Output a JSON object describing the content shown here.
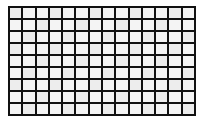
{
  "figure": {
    "kind": "lattice-grid"
  },
  "canvas": {
    "width": 203,
    "height": 122,
    "background_color": "#ffffff"
  },
  "grid": {
    "columns": 14,
    "rows": 9,
    "total_cells": 126,
    "line_color": "#111111",
    "line_width_px": 2,
    "outer_border_width_px": 2,
    "cell_fill_color": "#f4f4f4",
    "cell_alt_fill_color": "#ededed",
    "cell_width_px": 11,
    "cell_height_px": 10,
    "pitch_x_px": 13,
    "pitch_y_px": 12,
    "offset_left_px": 8,
    "offset_top_px": 6,
    "grid_width_px": 188,
    "grid_height_px": 110
  },
  "chart_data": {
    "type": "heatmap",
    "xlabel": "",
    "ylabel": "",
    "columns": 14,
    "rows": 9,
    "grid": true,
    "legend": "none",
    "values": [
      [
        1,
        1,
        1,
        1,
        1,
        1,
        1,
        1,
        1,
        1,
        1,
        1,
        1,
        1
      ],
      [
        1,
        1,
        1,
        1,
        1,
        1,
        1,
        1,
        1,
        1,
        1,
        1,
        1,
        1
      ],
      [
        1,
        1,
        1,
        1,
        1,
        1,
        1,
        1,
        1,
        1,
        1,
        1,
        1,
        1
      ],
      [
        1,
        1,
        1,
        1,
        1,
        1,
        1,
        1,
        1,
        1,
        1,
        1,
        1,
        1
      ],
      [
        1,
        1,
        1,
        1,
        1,
        1,
        1,
        1,
        1,
        1,
        1,
        1,
        1,
        1
      ],
      [
        1,
        1,
        1,
        1,
        1,
        1,
        1,
        1,
        1,
        1,
        1,
        1,
        1,
        1
      ],
      [
        1,
        1,
        1,
        1,
        1,
        1,
        1,
        1,
        1,
        1,
        1,
        1,
        1,
        1
      ],
      [
        1,
        1,
        1,
        1,
        1,
        1,
        1,
        1,
        1,
        1,
        1,
        1,
        1,
        1
      ],
      [
        1,
        1,
        1,
        1,
        1,
        1,
        1,
        1,
        1,
        1,
        1,
        1,
        1,
        1
      ]
    ]
  }
}
